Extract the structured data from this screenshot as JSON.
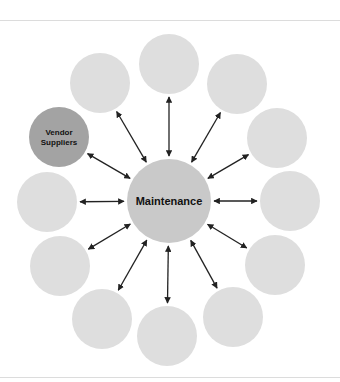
{
  "diagram": {
    "center": {
      "label": "Maintenance",
      "cx": 169,
      "cy": 201,
      "r": 42,
      "color": "#c9c9c9"
    },
    "satellites": [
      {
        "id": "top",
        "label": "",
        "cx": 169,
        "cy": 64,
        "r": 30,
        "color": "#dedede"
      },
      {
        "id": "upper-right",
        "label": "",
        "cx": 237,
        "cy": 84,
        "r": 30,
        "color": "#dedede"
      },
      {
        "id": "right-upper",
        "label": "",
        "cx": 277,
        "cy": 138,
        "r": 30,
        "color": "#dedede"
      },
      {
        "id": "right",
        "label": "",
        "cx": 290,
        "cy": 201,
        "r": 30,
        "color": "#dedede"
      },
      {
        "id": "right-lower",
        "label": "",
        "cx": 275,
        "cy": 265,
        "r": 30,
        "color": "#dedede"
      },
      {
        "id": "bottom-right",
        "label": "",
        "cx": 233,
        "cy": 317,
        "r": 30,
        "color": "#dedede"
      },
      {
        "id": "bottom",
        "label": "",
        "cx": 167,
        "cy": 336,
        "r": 30,
        "color": "#dedede"
      },
      {
        "id": "bottom-left",
        "label": "",
        "cx": 102,
        "cy": 319,
        "r": 30,
        "color": "#dedede"
      },
      {
        "id": "left-lower",
        "label": "",
        "cx": 60,
        "cy": 266,
        "r": 30,
        "color": "#dedede"
      },
      {
        "id": "left",
        "label": "",
        "cx": 47,
        "cy": 202,
        "r": 30,
        "color": "#dedede"
      },
      {
        "id": "vendor-suppliers",
        "label": "Vendor\nSuppliers",
        "label_lines": [
          "Vendor",
          "Suppliers"
        ],
        "cx": 59,
        "cy": 137,
        "r": 30,
        "color": "#a3a3a3"
      },
      {
        "id": "upper-left",
        "label": "",
        "cx": 100,
        "cy": 83,
        "r": 30,
        "color": "#dedede"
      }
    ],
    "connector": {
      "type": "double-arrow",
      "color": "#222222"
    },
    "rules": {
      "top_y": 20,
      "bottom_y": 377,
      "color": "#dcdcdc"
    }
  }
}
